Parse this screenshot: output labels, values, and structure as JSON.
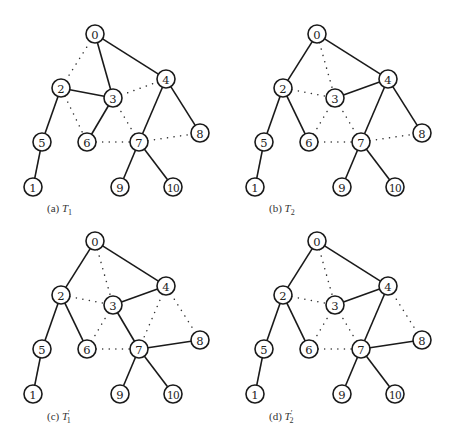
{
  "figure": {
    "node_radius": 9,
    "nodes": {
      "0": [
        95,
        34
      ],
      "1": [
        33,
        187
      ],
      "2": [
        61,
        88
      ],
      "3": [
        113,
        98
      ],
      "4": [
        166,
        79
      ],
      "5": [
        42,
        142
      ],
      "6": [
        87,
        142
      ],
      "7": [
        139,
        142
      ],
      "8": [
        200,
        133
      ],
      "9": [
        120,
        187
      ],
      "10": [
        173,
        187
      ]
    },
    "panels": [
      {
        "id": "a",
        "offset": [
          0,
          0
        ],
        "caption_prefix": "(a) ",
        "caption_var": "T",
        "caption_prime": "",
        "caption_sub": "1",
        "caption_pos": [
          47,
          212
        ],
        "solid_edges": [
          [
            0,
            3
          ],
          [
            0,
            4
          ],
          [
            2,
            3
          ],
          [
            3,
            6
          ],
          [
            2,
            5
          ],
          [
            5,
            1
          ],
          [
            4,
            7
          ],
          [
            4,
            8
          ],
          [
            7,
            9
          ],
          [
            7,
            10
          ]
        ],
        "dotted_edges": [
          [
            0,
            2
          ],
          [
            3,
            4
          ],
          [
            2,
            6
          ],
          [
            3,
            7
          ],
          [
            6,
            7
          ],
          [
            7,
            8
          ]
        ]
      },
      {
        "id": "b",
        "offset": [
          222,
          0
        ],
        "caption_prefix": "(b) ",
        "caption_var": "T",
        "caption_prime": "",
        "caption_sub": "2",
        "caption_pos": [
          269,
          212
        ],
        "solid_edges": [
          [
            0,
            2
          ],
          [
            0,
            4
          ],
          [
            4,
            3
          ],
          [
            2,
            5
          ],
          [
            2,
            6
          ],
          [
            5,
            1
          ],
          [
            4,
            7
          ],
          [
            4,
            8
          ],
          [
            7,
            9
          ],
          [
            7,
            10
          ]
        ],
        "dotted_edges": [
          [
            0,
            3
          ],
          [
            2,
            3
          ],
          [
            3,
            6
          ],
          [
            3,
            7
          ],
          [
            6,
            7
          ],
          [
            7,
            8
          ]
        ]
      },
      {
        "id": "c",
        "offset": [
          0,
          207
        ],
        "caption_prefix": "(c) ",
        "caption_var": "T",
        "caption_prime": "′",
        "caption_sub": "1",
        "caption_pos": [
          47,
          420
        ],
        "solid_edges": [
          [
            0,
            2
          ],
          [
            0,
            4
          ],
          [
            4,
            3
          ],
          [
            2,
            5
          ],
          [
            2,
            6
          ],
          [
            5,
            1
          ],
          [
            3,
            7
          ],
          [
            7,
            8
          ],
          [
            7,
            9
          ],
          [
            7,
            10
          ]
        ],
        "dotted_edges": [
          [
            0,
            3
          ],
          [
            2,
            3
          ],
          [
            3,
            6
          ],
          [
            4,
            7
          ],
          [
            4,
            8
          ],
          [
            6,
            7
          ]
        ]
      },
      {
        "id": "d",
        "offset": [
          222,
          207
        ],
        "caption_prefix": "(d) ",
        "caption_var": "T",
        "caption_prime": "′",
        "caption_sub": "2",
        "caption_pos": [
          269,
          420
        ],
        "solid_edges": [
          [
            0,
            2
          ],
          [
            0,
            4
          ],
          [
            4,
            3
          ],
          [
            2,
            5
          ],
          [
            2,
            6
          ],
          [
            5,
            1
          ],
          [
            4,
            7
          ],
          [
            7,
            8
          ],
          [
            7,
            9
          ],
          [
            7,
            10
          ]
        ],
        "dotted_edges": [
          [
            0,
            3
          ],
          [
            2,
            3
          ],
          [
            3,
            6
          ],
          [
            3,
            7
          ],
          [
            4,
            8
          ],
          [
            6,
            7
          ]
        ]
      }
    ],
    "colors": {
      "stroke": "#1a1a1a",
      "background": "#ffffff"
    }
  }
}
